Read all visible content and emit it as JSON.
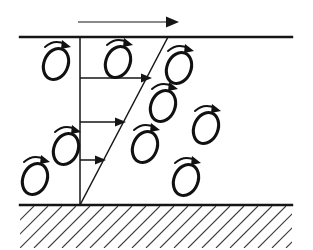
{
  "figure": {
    "background_color": "#ffffff",
    "ink_color": "#151515",
    "hatch_color": "#3a3a3a",
    "width": 313,
    "height": 250
  },
  "free_stream_arrow": {
    "label": "free-stream flow direction",
    "x1": 78,
    "y1": 22,
    "x2": 176,
    "y2": 22,
    "direction": "right"
  },
  "boundaries": {
    "top_edge": {
      "label": "upper boundary",
      "x1": 20,
      "y1": 37,
      "x2": 292,
      "y2": 37
    },
    "wall": {
      "label": "solid wall",
      "x1": 20,
      "y1": 205,
      "x2": 292,
      "y2": 205
    },
    "hatching": {
      "label": "wall hatching",
      "count": 22,
      "angle_deg": 45,
      "spacing": 14,
      "region_height": 42
    }
  },
  "velocity_profile": {
    "label": "mean velocity profile",
    "axis": {
      "x": 80,
      "y_top": 37,
      "y_bottom": 205
    },
    "profile_slant": {
      "x_top": 168,
      "y_top": 37,
      "x_bottom": 80,
      "y_bottom": 205
    },
    "arrows": [
      {
        "name": "velocity-arrow-upper",
        "x1": 80,
        "y": 78,
        "x2": 150
      },
      {
        "name": "velocity-arrow-middle",
        "x1": 80,
        "y": 122,
        "x2": 124
      },
      {
        "name": "velocity-arrow-lower",
        "x1": 80,
        "y": 160,
        "x2": 104
      }
    ]
  },
  "eddies": {
    "label": "rotating eddies",
    "rotation": "clockwise",
    "items": [
      {
        "name": "eddy-1",
        "cx": 56,
        "cy": 64,
        "rx": 12,
        "ry": 16,
        "tilt": 22
      },
      {
        "name": "eddy-2",
        "cx": 118,
        "cy": 62,
        "rx": 12,
        "ry": 16,
        "tilt": 22
      },
      {
        "name": "eddy-3",
        "cx": 179,
        "cy": 68,
        "rx": 12,
        "ry": 16,
        "tilt": 22
      },
      {
        "name": "eddy-4",
        "cx": 163,
        "cy": 106,
        "rx": 12,
        "ry": 16,
        "tilt": 22
      },
      {
        "name": "eddy-5",
        "cx": 206,
        "cy": 128,
        "rx": 12,
        "ry": 16,
        "tilt": 22
      },
      {
        "name": "eddy-6",
        "cx": 145,
        "cy": 147,
        "rx": 12,
        "ry": 16,
        "tilt": 22
      },
      {
        "name": "eddy-7",
        "cx": 66,
        "cy": 149,
        "rx": 12,
        "ry": 16,
        "tilt": 22
      },
      {
        "name": "eddy-8",
        "cx": 186,
        "cy": 180,
        "rx": 12,
        "ry": 16,
        "tilt": 22
      },
      {
        "name": "eddy-9",
        "cx": 35,
        "cy": 179,
        "rx": 12,
        "ry": 16,
        "tilt": 22
      }
    ]
  }
}
